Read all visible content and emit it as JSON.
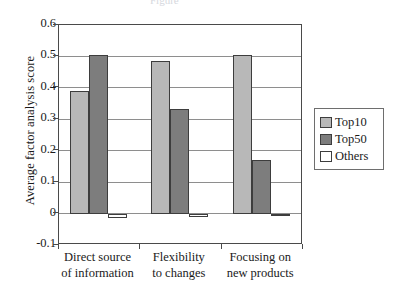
{
  "chart_data": {
    "type": "bar",
    "title": "",
    "xlabel": "",
    "ylabel": "Average factor analysis score",
    "ylim": [
      -0.1,
      0.6
    ],
    "yticks": [
      "0.6",
      "0.5",
      "0.4",
      "0.3",
      "0.2",
      "0.1",
      "0",
      "-0.1"
    ],
    "ytick_values": [
      0.6,
      0.5,
      0.4,
      0.3,
      0.2,
      0.1,
      0,
      -0.1
    ],
    "grid": true,
    "legend_position": "right",
    "categories": [
      {
        "line1": "Direct source",
        "line2": "of information"
      },
      {
        "line1": "Flexibility",
        "line2": "to changes"
      },
      {
        "line1": "Focusing on",
        "line2": "new products"
      }
    ],
    "series": [
      {
        "name": "Top10",
        "color": "#b8b8b8",
        "values": [
          0.39,
          0.485,
          0.505
        ]
      },
      {
        "name": "Top50",
        "color": "#7d7d7d",
        "values": [
          0.505,
          0.333,
          0.17
        ]
      },
      {
        "name": "Others",
        "color": "#ffffff",
        "values": [
          -0.015,
          -0.012,
          -0.008
        ]
      }
    ]
  },
  "title_sliver": "Figure"
}
